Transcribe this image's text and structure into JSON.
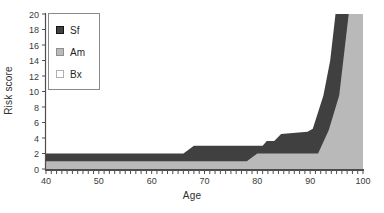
{
  "figure": {
    "background_color": "#ffffff",
    "text_color": "#2e2e2e"
  },
  "chart_data": {
    "type": "area",
    "stacked": true,
    "title": "",
    "xlabel": "Age",
    "ylabel": "Risk score",
    "grid": false,
    "legend_position": "upper-left-inside",
    "x_axis": {
      "min": 40,
      "max": 100,
      "minor_tick_step": 1,
      "major_tick_step": 10,
      "tick_labels": [
        "40",
        "50",
        "60",
        "70",
        "80",
        "90",
        "100"
      ]
    },
    "y_axis": {
      "min": 0,
      "max": 20,
      "tick_step": 2,
      "tick_labels": [
        "0",
        "2",
        "4",
        "6",
        "8",
        "10",
        "12",
        "14",
        "16",
        "18",
        "20"
      ]
    },
    "series": [
      {
        "name": "Sf",
        "color": "#404040",
        "swatch_border": "#141414",
        "boundary": "top of dark band = cumulative total (Am + Sf), clipped at 20",
        "points": [
          [
            40,
            2
          ],
          [
            66,
            2
          ],
          [
            68,
            3
          ],
          [
            81,
            3
          ],
          [
            81.8,
            3.6
          ],
          [
            83.2,
            3.6
          ],
          [
            84.5,
            4.5
          ],
          [
            89.5,
            4.8
          ],
          [
            90.5,
            5.2
          ],
          [
            92.5,
            9.5
          ],
          [
            93.8,
            14
          ],
          [
            94.8,
            20
          ],
          [
            100,
            20
          ]
        ]
      },
      {
        "name": "Am",
        "color": "#b9b9b9",
        "swatch_border": "#8f8f8f",
        "boundary": "top of light-gray bottom band",
        "points": [
          [
            40,
            1
          ],
          [
            78,
            1
          ],
          [
            80,
            2
          ],
          [
            91.5,
            2
          ],
          [
            93.5,
            5
          ],
          [
            95.5,
            9.5
          ],
          [
            97.3,
            20
          ],
          [
            100,
            20
          ]
        ]
      },
      {
        "name": "Bx",
        "color": "#ffffff",
        "swatch_border": "#b0b0b0",
        "boundary": "white fill - not distinguishable from background in the figure",
        "points": []
      }
    ],
    "axis_color": "#4d4d4d",
    "tick_label_color": "#3a3a3a",
    "tick_label_font_px": 9
  }
}
